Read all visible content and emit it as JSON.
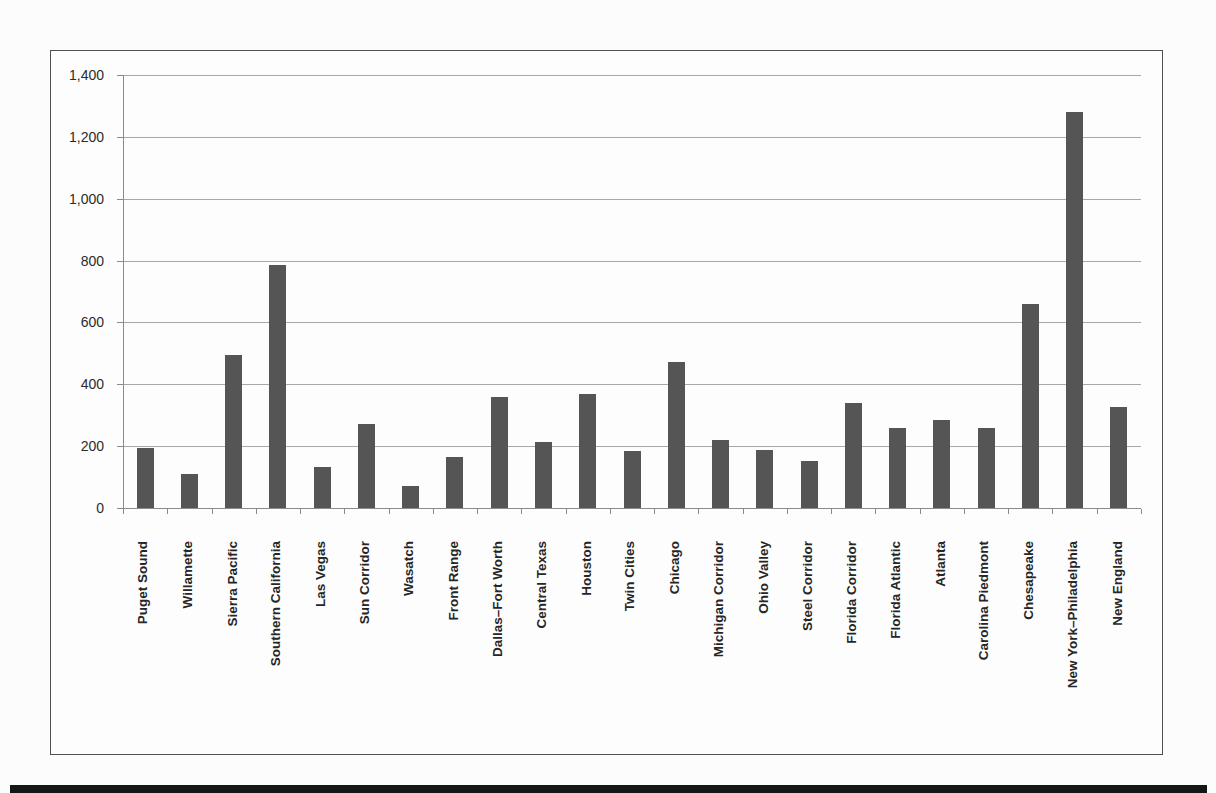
{
  "page": {
    "background_color": "#fcfcfc",
    "footer_band_color": "#161616"
  },
  "figure": {
    "border_color": "#4f4f4f",
    "background_color": "#fdfdfd"
  },
  "chart_data": {
    "type": "bar",
    "title": "",
    "xlabel": "",
    "ylabel": "",
    "categories": [
      "Puget Sound",
      "Willamette",
      "Sierra Pacific",
      "Southern California",
      "Las Vegas",
      "Sun Corridor",
      "Wasatch",
      "Front Range",
      "Dallas–Fort Worth",
      "Central Texas",
      "Houston",
      "Twin Cities",
      "Chicago",
      "Michigan Corridor",
      "Ohio Valley",
      "Steel Corridor",
      "Florida Corridor",
      "Florida Atlantic",
      "Atlanta",
      "Carolina Piedmont",
      "Chesapeake",
      "New York–Philadelphia",
      "New England"
    ],
    "values": [
      195,
      110,
      495,
      785,
      132,
      270,
      72,
      165,
      360,
      215,
      370,
      185,
      472,
      220,
      187,
      153,
      340,
      260,
      285,
      260,
      660,
      1280,
      328
    ],
    "ylim": [
      0,
      1400
    ],
    "ytick_interval": 200,
    "ytick_labels": [
      "0",
      "200",
      "400",
      "600",
      "800",
      "1,000",
      "1,200",
      "1,400"
    ],
    "grid": true,
    "legend": "none",
    "bar_color": "#555555",
    "gridline_color": "#a8a8a8",
    "axis_color": "#8a8a8a",
    "tick_label_color": "#2b2b2b",
    "category_label_color": "#262626"
  }
}
